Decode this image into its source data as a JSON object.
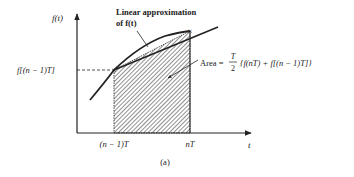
{
  "figure": {
    "caption": "(a)",
    "axes": {
      "y_label": "f(t)",
      "x_label": "t",
      "x_ticks": [
        "(n − 1)T",
        "nT"
      ],
      "y_ticks": [
        "f[(n − 1)T]"
      ]
    },
    "annotations": {
      "linear_approx_line1": "Linear approximation",
      "linear_approx_line2": "of f(t)",
      "area_prefix": "Area =",
      "area_frac_num": "T",
      "area_frac_den": "2",
      "area_expression": "{f(nT) + f[(n − 1)T]}"
    },
    "colors": {
      "ink": "#222222",
      "background": "#ffffff"
    }
  }
}
